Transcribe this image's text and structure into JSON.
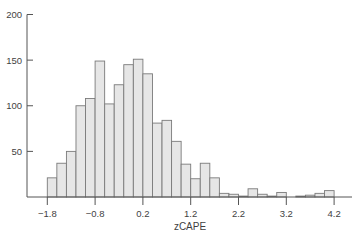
{
  "chart_data": {
    "type": "bar",
    "subtype": "histogram",
    "title": "",
    "xlabel": "zCAPE",
    "ylabel": "",
    "bin_width": 0.2,
    "bin_start": -1.8,
    "bins": [
      [
        -1.8,
        -1.6
      ],
      [
        -1.6,
        -1.4
      ],
      [
        -1.4,
        -1.2
      ],
      [
        -1.2,
        -1.0
      ],
      [
        -1.0,
        -0.8
      ],
      [
        -0.8,
        -0.6
      ],
      [
        -0.6,
        -0.4
      ],
      [
        -0.4,
        -0.2
      ],
      [
        -0.2,
        0.0
      ],
      [
        0.0,
        0.2
      ],
      [
        0.2,
        0.4
      ],
      [
        0.4,
        0.6
      ],
      [
        0.6,
        0.8
      ],
      [
        0.8,
        1.0
      ],
      [
        1.0,
        1.2
      ],
      [
        1.2,
        1.4
      ],
      [
        1.4,
        1.6
      ],
      [
        1.6,
        1.8
      ],
      [
        1.8,
        2.0
      ],
      [
        2.0,
        2.2
      ],
      [
        2.2,
        2.4
      ],
      [
        2.4,
        2.6
      ],
      [
        2.6,
        2.8
      ],
      [
        2.8,
        3.0
      ],
      [
        3.0,
        3.2
      ],
      [
        3.2,
        3.4
      ],
      [
        3.4,
        3.6
      ],
      [
        3.6,
        3.8
      ],
      [
        3.8,
        4.0
      ],
      [
        4.0,
        4.2
      ]
    ],
    "values": [
      21,
      37,
      50,
      100,
      108,
      149,
      102,
      123,
      145,
      151,
      135,
      81,
      84,
      61,
      36,
      20,
      37,
      21,
      4,
      3,
      1,
      9,
      3,
      1,
      5,
      0,
      1,
      2,
      4,
      7
    ],
    "xlim": [
      -1.8,
      4.6
    ],
    "ylim": [
      0,
      200
    ],
    "x_ticks": [
      -1.8,
      -0.8,
      0.2,
      1.2,
      2.2,
      3.2,
      4.2
    ],
    "x_tick_labels": [
      "−1.8",
      "−0.8",
      "0.2",
      "1.2",
      "2.2",
      "3.2",
      "4.2"
    ],
    "y_ticks": [
      50,
      100,
      150,
      200
    ],
    "y_tick_labels": [
      "50",
      "100",
      "150",
      "200"
    ],
    "grid": false,
    "legend": null,
    "colors": {
      "bar_fill": "#e6e6e6",
      "bar_stroke": "#7a7a7a",
      "axis": "#555555",
      "text": "#3f3f3f"
    }
  }
}
